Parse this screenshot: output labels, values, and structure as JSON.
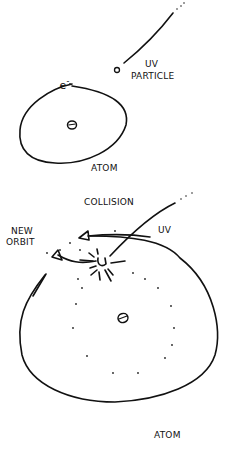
{
  "diagram": {
    "top_panel": {
      "electron_label": "e",
      "electron_superscript": "-",
      "particle_label_line1": "UV",
      "particle_label_line2": "PARTICLE",
      "atom_label": "ATOM"
    },
    "bottom_panel": {
      "title": "COLLISION",
      "uv_label": "UV",
      "new_orbit_line1": "NEW",
      "new_orbit_line2": "ORBIT",
      "atom_label": "ATOM"
    },
    "colors": {
      "ink": "#111111",
      "background": "#ffffff"
    }
  }
}
